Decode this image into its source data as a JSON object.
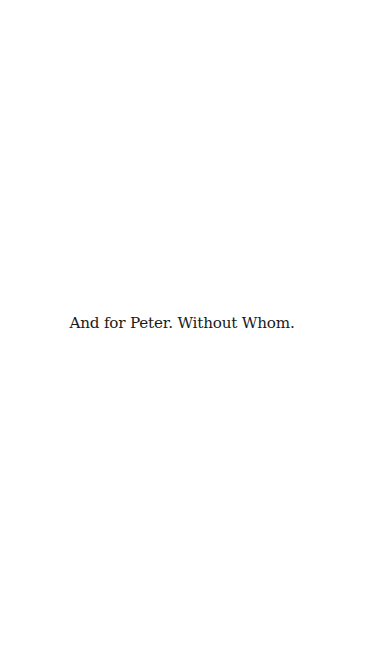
{
  "page": {
    "background": "#ffffff",
    "text_color": "#1a1a1a",
    "dedication": "And for Peter. Without Whom."
  }
}
